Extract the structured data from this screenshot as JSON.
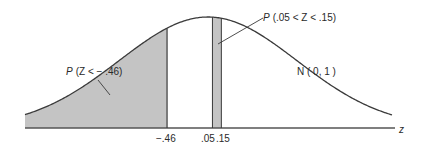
{
  "figure": {
    "distribution_label": "N ( 0, 1 )",
    "axis_label": "z",
    "ticks": [
      {
        "value": -0.46,
        "label": "−.46"
      },
      {
        "value": 0.05,
        "label": ".05"
      },
      {
        "value": 0.15,
        "label": ".15"
      }
    ],
    "regions": [
      {
        "name": "left-tail",
        "from": null,
        "to": -0.46,
        "label_prefix": "P",
        "label_body": "(Z < − .46)"
      },
      {
        "name": "strip",
        "from": 0.05,
        "to": 0.15,
        "label_prefix": "P",
        "label_body": "(.05 < Z < .15)"
      }
    ],
    "colors": {
      "curve": "#3a3a3a",
      "fill": "#c4c4c4",
      "axis": "#555555",
      "text": "#2a2a2a"
    }
  }
}
